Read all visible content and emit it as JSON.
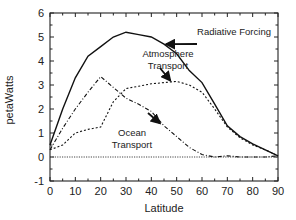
{
  "chart_data": {
    "type": "line",
    "title": "",
    "xlabel": "Latitude",
    "ylabel": "petaWatts",
    "xlim": [
      0,
      90
    ],
    "ylim": [
      -1,
      6
    ],
    "xticks": [
      0,
      10,
      20,
      30,
      40,
      50,
      60,
      70,
      80,
      90
    ],
    "yticks": [
      -1,
      0,
      1,
      2,
      3,
      4,
      5,
      6
    ],
    "grid": false,
    "legend": "none (inline annotations with arrows)",
    "x": [
      0,
      5,
      10,
      15,
      20,
      25,
      30,
      35,
      40,
      45,
      50,
      55,
      60,
      65,
      70,
      75,
      80,
      85,
      90
    ],
    "series": [
      {
        "name": "Radiative Forcing",
        "style": "solid",
        "values": [
          0.5,
          2.0,
          3.3,
          4.2,
          4.6,
          5.0,
          5.2,
          5.1,
          5.0,
          4.7,
          4.3,
          3.6,
          3.1,
          2.2,
          1.3,
          0.85,
          0.55,
          0.3,
          0.05
        ]
      },
      {
        "name": "Atmosphere Transport",
        "style": "dotted",
        "values": [
          0.3,
          0.5,
          1.0,
          1.15,
          1.25,
          2.3,
          2.85,
          2.95,
          3.05,
          3.1,
          3.15,
          3.0,
          2.7,
          2.0,
          1.25,
          0.8,
          0.5,
          0.3,
          0.05
        ]
      },
      {
        "name": "Ocean Transport",
        "style": "dash-dot",
        "values": [
          0.3,
          1.2,
          2.0,
          2.7,
          3.35,
          2.9,
          2.45,
          2.2,
          1.9,
          1.3,
          0.85,
          0.4,
          0.1,
          0.0,
          0.05,
          0.0,
          0.0,
          0.0,
          0.05
        ]
      }
    ],
    "reference_line": {
      "y": 0,
      "style": "dotted"
    },
    "annotations": [
      {
        "text": "Radiative Forcing",
        "lines": [
          "Radiative Forcing"
        ],
        "arrow_to": [
          45,
          4.7
        ]
      },
      {
        "text": "Atmosphere Transport",
        "lines": [
          "Atmosphere",
          "Transport"
        ],
        "arrow_to": [
          48,
          3.12
        ]
      },
      {
        "text": "Ocean Transport",
        "lines": [
          "Ocean",
          "Transport"
        ],
        "arrow_to": [
          44,
          1.35
        ]
      }
    ]
  }
}
